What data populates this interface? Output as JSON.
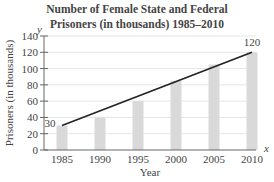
{
  "chart_data": {
    "type": "bar",
    "title": "Number of Female State and Federal Prisoners (in thousands) 1985–2010",
    "title_lines": [
      "Number of Female State and Federal",
      "Prisoners (in thousands) 1985–2010"
    ],
    "xlabel": "Year",
    "ylabel": "Prisoners (in thousands)",
    "x_axis_var": "x",
    "y_axis_var": "y",
    "categories": [
      "1985",
      "1990",
      "1995",
      "2000",
      "2005",
      "2010"
    ],
    "values": [
      30,
      40,
      60,
      85,
      105,
      120
    ],
    "ylim": [
      0,
      140
    ],
    "yticks": [
      "0",
      "20",
      "40",
      "60",
      "80",
      "100",
      "120",
      "140"
    ],
    "grid": true,
    "trend_line": {
      "from": {
        "x": "1985",
        "y": 30
      },
      "to": {
        "x": "2010",
        "y": 120
      }
    },
    "annotations": [
      {
        "x": "1985",
        "text": "30"
      },
      {
        "x": "2010",
        "text": "120"
      }
    ],
    "bar_color": "#d9d9d9",
    "line_color": "#222222"
  }
}
